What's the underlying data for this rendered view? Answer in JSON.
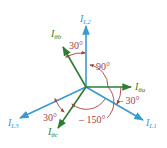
{
  "colors": {
    "line_current": "#3a9ad0",
    "phase_current": "#2e7d32",
    "angle": "#a0443f",
    "background": "#ffffff"
  },
  "phasors": {
    "IL1": {
      "main": "I",
      "sub": "L1",
      "angle_deg": -30
    },
    "IL2": {
      "main": "I",
      "sub": "L2",
      "angle_deg": 90
    },
    "IL3": {
      "main": "I",
      "sub": "L3",
      "angle_deg": 210
    },
    "Ia": {
      "main": "I",
      "sub": "θa",
      "angle_deg": 0
    },
    "Ib": {
      "main": "I",
      "sub": "θb",
      "angle_deg": 120
    },
    "Ic": {
      "main": "I",
      "sub": "θc",
      "angle_deg": 240
    }
  },
  "angles": {
    "b_to_L2": "30°",
    "a_to_b": "90°",
    "a_to_L1": "– 30°",
    "c_to_L3": "30°",
    "a_to_c": "– 150°"
  }
}
